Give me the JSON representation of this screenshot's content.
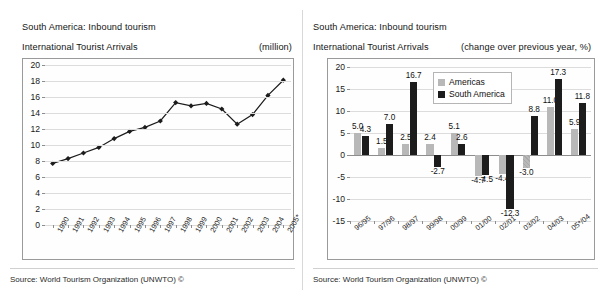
{
  "left_panel": {
    "title": "South America: Inbound tourism",
    "subtitle": "International Tourist Arrivals",
    "unit": "(million)",
    "source": "Source: World Tourism Organization (UNWTO) ©"
  },
  "right_panel": {
    "title": "South America: Inbound tourism",
    "subtitle": "International Tourist Arrivals",
    "unit": "(change over previous year, %)",
    "source": "Source: World Tourism Organization (UNWTO) ©"
  },
  "chart_data": [
    {
      "type": "line",
      "title": "South America: Inbound tourism",
      "subtitle": "International Tourist Arrivals",
      "ylabel": "(million)",
      "xlabel": "",
      "ylim": [
        0,
        20
      ],
      "yticks": [
        0,
        2,
        4,
        6,
        8,
        10,
        12,
        14,
        16,
        18,
        20
      ],
      "grid": true,
      "legend": "none",
      "categories": [
        "1990",
        "1991",
        "1992",
        "1993",
        "1994",
        "1995",
        "1996",
        "1997",
        "1998",
        "1999",
        "2000",
        "2001",
        "2002",
        "2003",
        "2004",
        "2005*"
      ],
      "values": [
        7.7,
        8.3,
        9.0,
        9.7,
        10.8,
        11.7,
        12.2,
        13.0,
        15.3,
        14.9,
        15.2,
        14.5,
        12.6,
        13.8,
        16.2,
        18.1
      ],
      "marker": "diamond",
      "line_color": "#1c1c1c"
    },
    {
      "type": "bar",
      "title": "South America: Inbound tourism",
      "subtitle": "International Tourist Arrivals",
      "ylabel": "(change over previous year, %)",
      "xlabel": "",
      "ylim": [
        -15,
        20
      ],
      "yticks": [
        -15,
        -10,
        -5,
        0,
        5,
        10,
        15,
        20
      ],
      "grid": true,
      "legend": "inside-top-center",
      "categories": [
        "96/95",
        "97/96",
        "98/97",
        "99/98",
        "00/99",
        "01/00",
        "02/01",
        "03/02",
        "04/03",
        "05*/04"
      ],
      "series": [
        {
          "name": "Americas",
          "color": "#b8b8b8",
          "values": [
            5.0,
            1.5,
            2.5,
            2.4,
            5.1,
            -4.7,
            -4.4,
            -3.0,
            11.0,
            5.9
          ],
          "labels": [
            "5.0",
            "1.5",
            "2.5",
            "2.4",
            "5.1",
            "-4.7",
            "-4.4",
            "-3.0",
            "11.0",
            "5.9"
          ]
        },
        {
          "name": "South America",
          "color": "#1c1c1c",
          "values": [
            4.3,
            7.0,
            16.7,
            -2.7,
            2.6,
            -4.5,
            -12.3,
            8.8,
            17.3,
            11.8
          ],
          "labels": [
            "4.3",
            "7.0",
            "16.7",
            "-2.7",
            "2.6",
            "-4.5",
            "-12.3",
            "8.8",
            "17.3",
            "11.8"
          ]
        }
      ]
    }
  ]
}
